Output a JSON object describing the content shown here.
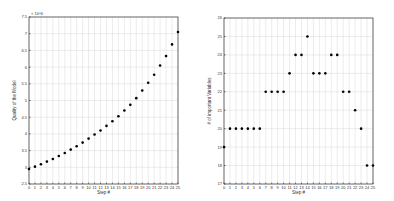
{
  "chart_data": [
    {
      "type": "scatter",
      "title": "",
      "xlabel": "Step #",
      "ylabel": "Quality of the Model",
      "y_exponent_label": "× 10^6",
      "x": [
        0,
        1,
        2,
        3,
        4,
        5,
        6,
        7,
        8,
        9,
        10,
        11,
        12,
        13,
        14,
        15,
        16,
        17,
        18,
        19,
        20,
        21,
        22,
        23,
        24,
        25
      ],
      "values": [
        2.95,
        3.02,
        3.09,
        3.17,
        3.25,
        3.34,
        3.43,
        3.53,
        3.63,
        3.74,
        3.86,
        3.98,
        4.1,
        4.24,
        4.38,
        4.53,
        4.7,
        4.87,
        5.07,
        5.3,
        5.53,
        5.77,
        6.05,
        6.33,
        6.68,
        7.05
      ],
      "xlim": [
        0,
        25
      ],
      "ylim": [
        2.5,
        7.5
      ],
      "xticks": [
        "0",
        "1",
        "2",
        "3",
        "4",
        "5",
        "6",
        "7",
        "8",
        "9",
        "10",
        "11",
        "12",
        "13",
        "14",
        "15",
        "16",
        "17",
        "18",
        "19",
        "20",
        "21",
        "22",
        "23",
        "24",
        "25"
      ],
      "yticks": [
        "2.5",
        "3",
        "3.5",
        "4",
        "4.5",
        "5",
        "5.5",
        "6",
        "6.5",
        "7",
        "7.5"
      ],
      "grid": true,
      "legend": "none"
    },
    {
      "type": "scatter",
      "title": "",
      "xlabel": "Step #",
      "ylabel": "# of important Variables",
      "x": [
        0,
        1,
        2,
        3,
        4,
        5,
        6,
        7,
        8,
        9,
        10,
        11,
        12,
        13,
        14,
        15,
        16,
        17,
        18,
        19,
        20,
        21,
        22,
        23,
        24,
        25
      ],
      "values": [
        19,
        20,
        20,
        20,
        20,
        20,
        20,
        22,
        22,
        22,
        22,
        23,
        24,
        24,
        25,
        23,
        23,
        23,
        24,
        24,
        22,
        22,
        21,
        20,
        18,
        18
      ],
      "xlim": [
        0,
        25
      ],
      "ylim": [
        17,
        26
      ],
      "xticks": [
        "0",
        "1",
        "2",
        "3",
        "4",
        "5",
        "6",
        "7",
        "8",
        "9",
        "10",
        "11",
        "12",
        "13",
        "14",
        "15",
        "16",
        "17",
        "18",
        "19",
        "20",
        "21",
        "22",
        "23",
        "24",
        "25"
      ],
      "yticks": [
        "17",
        "18",
        "19",
        "20",
        "21",
        "22",
        "23",
        "24",
        "25",
        "26"
      ],
      "grid": true,
      "legend": "none"
    }
  ]
}
